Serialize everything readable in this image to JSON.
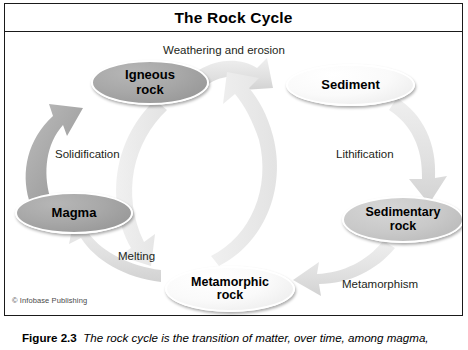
{
  "figure": {
    "title": "The Rock Cycle",
    "credit": "© Infobase Publishing",
    "caption_number": "Figure 2.3",
    "caption_text": "The rock cycle is the transition of matter, over time, among magma,"
  },
  "diagram": {
    "type": "cycle-diagram",
    "nodes": [
      {
        "id": "igneous",
        "label_line1": "Igneous",
        "label_line2": "rock",
        "fill": "#a8a8a8",
        "tone": "dark"
      },
      {
        "id": "sediment",
        "label_line1": "Sediment",
        "label_line2": "",
        "fill": "#fafafa",
        "tone": "light"
      },
      {
        "id": "sedimentary",
        "label_line1": "Sedimentary",
        "label_line2": "rock",
        "fill": "#c9c9c9",
        "tone": "mid"
      },
      {
        "id": "metamorphic",
        "label_line1": "Metamorphic",
        "label_line2": "rock",
        "fill": "#f2f2f2",
        "tone": "light"
      },
      {
        "id": "magma",
        "label_line1": "Magma",
        "label_line2": "",
        "fill": "#a8a8a8",
        "tone": "dark"
      }
    ],
    "edges": [
      {
        "from": "igneous",
        "to": "sediment",
        "label": "Weathering and erosion"
      },
      {
        "from": "sediment",
        "to": "sedimentary",
        "label": "Lithification"
      },
      {
        "from": "sedimentary",
        "to": "metamorphic",
        "label": "Metamorphism"
      },
      {
        "from": "metamorphic",
        "to": "magma",
        "label": "Melting"
      },
      {
        "from": "magma",
        "to": "igneous",
        "label": "Solidification"
      },
      {
        "from": "igneous",
        "to": "metamorphic",
        "label": ""
      },
      {
        "from": "metamorphic",
        "to": "sediment",
        "label": ""
      }
    ],
    "colors": {
      "arrow_dark": "#a9a9a9",
      "arrow_light": "#e2e2e2",
      "border": "#1a1a1a",
      "background": "#ffffff",
      "text": "#231f20"
    }
  }
}
